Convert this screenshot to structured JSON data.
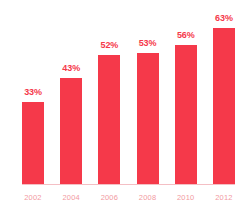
{
  "chart_data": {
    "type": "bar",
    "title": "",
    "subtitle": "",
    "xlabel": "",
    "ylabel": "",
    "categories": [
      "2002",
      "2004",
      "2006",
      "2008",
      "2010",
      "2012"
    ],
    "values": [
      33,
      43,
      52,
      53,
      56,
      63
    ],
    "value_labels": [
      "33%",
      "43%",
      "52%",
      "53%",
      "56%",
      "63%"
    ],
    "ylim": [
      0,
      70
    ],
    "grid": false,
    "legend": null,
    "bar_color": "#F5394A",
    "value_label_color": "#F5394A",
    "tick_label_color": "#F29AA2",
    "axis_line_color": "#F4BFC4",
    "background_color": "#FFFFFF"
  }
}
